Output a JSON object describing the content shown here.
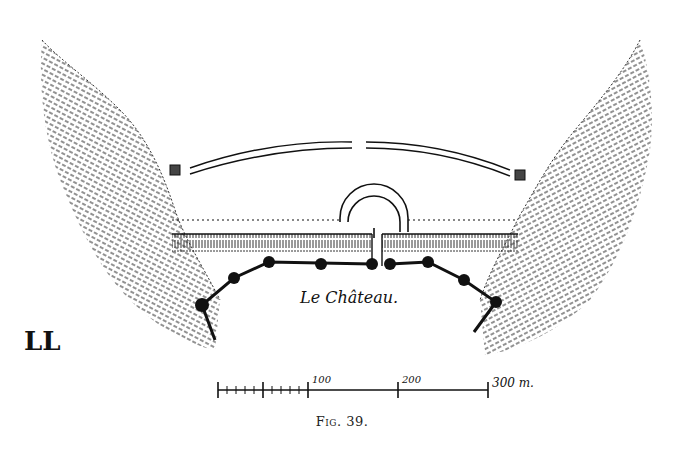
{
  "figure": {
    "caption_prefix": "Fig.",
    "caption_number": "39.",
    "place_label": "Le Château.",
    "monogram": "LL"
  },
  "scale_bar": {
    "labels": [
      "100",
      "200",
      "300 m."
    ],
    "unit": "m",
    "max": 300,
    "major_ticks": [
      0,
      50,
      100,
      200,
      300
    ],
    "minor_subdivisions": "10 m between 0 and 100"
  },
  "features": {
    "hillsides": [
      "left-hatched-slope",
      "right-hatched-slope"
    ],
    "outer_wall": "curved double-line rampart with gap at center",
    "inner_line": "dotted line with semicircular bastion at center",
    "ditch": "hatched ditch band",
    "fortification": "polygonal wall with round towers",
    "tower_count": 9
  }
}
